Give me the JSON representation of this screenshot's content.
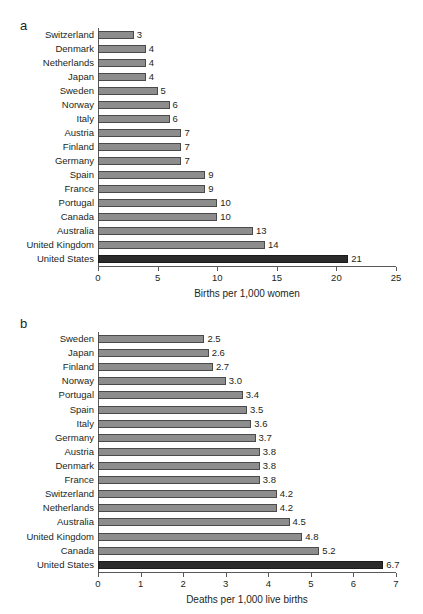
{
  "figure": {
    "panel_a_letter": "a",
    "panel_b_letter": "b"
  },
  "chart_data": [
    {
      "type": "bar",
      "orientation": "horizontal",
      "panel": "a",
      "title": "",
      "xlabel": "Births per 1,000 women",
      "ylabel": "",
      "xlim": [
        0,
        25
      ],
      "xticks": [
        0,
        5,
        10,
        15,
        20,
        25
      ],
      "xtick_labels": [
        "0",
        "5",
        "10",
        "15",
        "20",
        "25"
      ],
      "grid": false,
      "legend": "none",
      "highlight_category": "United States",
      "colors": {
        "bar": "#8d8d8d",
        "bar_edge": "#4a4a4a",
        "highlight": "#2b2b2b",
        "axis": "#58595b",
        "text": "#231f20"
      },
      "categories": [
        "Switzerland",
        "Denmark",
        "Netherlands",
        "Japan",
        "Sweden",
        "Norway",
        "Italy",
        "Austria",
        "Finland",
        "Germany",
        "Spain",
        "France",
        "Portugal",
        "Canada",
        "Australia",
        "United Kingdom",
        "United States"
      ],
      "values": [
        3,
        4,
        4,
        4,
        5,
        6,
        6,
        7,
        7,
        7,
        9,
        9,
        10,
        10,
        13,
        14,
        21
      ],
      "value_labels": [
        "3",
        "4",
        "4",
        "4",
        "5",
        "6",
        "6",
        "7",
        "7",
        "7",
        "9",
        "9",
        "10",
        "10",
        "13",
        "14",
        "21"
      ]
    },
    {
      "type": "bar",
      "orientation": "horizontal",
      "panel": "b",
      "title": "",
      "xlabel": "Deaths per 1,000 live births",
      "ylabel": "",
      "xlim": [
        0,
        7
      ],
      "xticks": [
        0,
        1,
        2,
        3,
        4,
        5,
        6,
        7
      ],
      "xtick_labels": [
        "0",
        "1",
        "2",
        "3",
        "4",
        "5",
        "6",
        "7"
      ],
      "grid": false,
      "legend": "none",
      "highlight_category": "United States",
      "colors": {
        "bar": "#8d8d8d",
        "bar_edge": "#4a4a4a",
        "highlight": "#2b2b2b",
        "axis": "#58595b",
        "text": "#231f20"
      },
      "categories": [
        "Sweden",
        "Japan",
        "Finland",
        "Norway",
        "Portugal",
        "Spain",
        "Italy",
        "Germany",
        "Austria",
        "Denmark",
        "France",
        "Switzerland",
        "Netherlands",
        "Australia",
        "United Kingdom",
        "Canada",
        "United States"
      ],
      "values": [
        2.5,
        2.6,
        2.7,
        3.0,
        3.4,
        3.5,
        3.6,
        3.7,
        3.8,
        3.8,
        3.8,
        4.2,
        4.2,
        4.5,
        4.8,
        5.2,
        6.7
      ],
      "value_labels": [
        "2.5",
        "2.6",
        "2.7",
        "3.0",
        "3.4",
        "3.5",
        "3.6",
        "3.7",
        "3.8",
        "3.8",
        "3.8",
        "4.2",
        "4.2",
        "4.5",
        "4.8",
        "5.2",
        "6.7"
      ]
    }
  ]
}
